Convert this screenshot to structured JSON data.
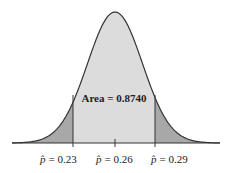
{
  "chart_data": {
    "type": "area",
    "title": "",
    "distribution": "normal",
    "mean": 0.26,
    "boundaries": [
      0.23,
      0.29
    ],
    "tick_labels": [
      "p̂ = 0.23",
      "p̂ = 0.26",
      "p̂ = 0.29"
    ],
    "annotation": "Area = 0.8740",
    "shaded_center_area": 0.874,
    "tail_areas_each": 0.063,
    "colors": {
      "center": "#dcdcdc",
      "tails": "#a8a8a8",
      "curve": "#333333"
    }
  },
  "labels": {
    "area": "Area = 0.8740",
    "left_symbol": "p̂",
    "left_value": "= 0.23",
    "mid_symbol": "p̂",
    "mid_value": "= 0.26",
    "right_symbol": "p̂",
    "right_value": "= 0.29"
  }
}
